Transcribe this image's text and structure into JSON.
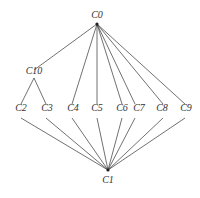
{
  "diagram": {
    "type": "hasse-lattice",
    "nodes": [
      {
        "id": "C0",
        "label": "C0",
        "x": 97,
        "y": 24,
        "lx": 97,
        "ly": 18
      },
      {
        "id": "C10",
        "label": "C10",
        "x": 34,
        "y": 78,
        "lx": 34,
        "ly": 74
      },
      {
        "id": "C2",
        "label": "C2",
        "x": 21,
        "y": 116,
        "lx": 21,
        "ly": 111
      },
      {
        "id": "C3",
        "label": "C3",
        "x": 46,
        "y": 116,
        "lx": 47,
        "ly": 111
      },
      {
        "id": "C4",
        "label": "C4",
        "x": 72,
        "y": 116,
        "lx": 73,
        "ly": 111
      },
      {
        "id": "C5",
        "label": "C5",
        "x": 97,
        "y": 116,
        "lx": 97,
        "ly": 111
      },
      {
        "id": "C6",
        "label": "C6",
        "x": 122,
        "y": 116,
        "lx": 122,
        "ly": 111
      },
      {
        "id": "C7",
        "label": "C7",
        "x": 135,
        "y": 116,
        "lx": 139,
        "ly": 111
      },
      {
        "id": "C8",
        "label": "C8",
        "x": 163,
        "y": 116,
        "lx": 162,
        "ly": 111
      },
      {
        "id": "C9",
        "label": "C9",
        "x": 185,
        "y": 116,
        "lx": 186,
        "ly": 111
      },
      {
        "id": "C1",
        "label": "C1",
        "x": 108,
        "y": 170,
        "lx": 108,
        "ly": 183
      }
    ],
    "edges": [
      [
        "C0",
        "C10"
      ],
      [
        "C0",
        "C4"
      ],
      [
        "C0",
        "C5"
      ],
      [
        "C0",
        "C6"
      ],
      [
        "C0",
        "C7"
      ],
      [
        "C0",
        "C8"
      ],
      [
        "C0",
        "C9"
      ],
      [
        "C10",
        "C2"
      ],
      [
        "C10",
        "C3"
      ],
      [
        "C2",
        "C1"
      ],
      [
        "C3",
        "C1"
      ],
      [
        "C4",
        "C1"
      ],
      [
        "C5",
        "C1"
      ],
      [
        "C6",
        "C1"
      ],
      [
        "C7",
        "C1"
      ],
      [
        "C8",
        "C1"
      ],
      [
        "C9",
        "C1"
      ]
    ],
    "upper_stub_points": {
      "C4": [
        72,
        97
      ],
      "C5": [
        97,
        97
      ],
      "C6": [
        122,
        97
      ],
      "C7": [
        135,
        97
      ],
      "C8": [
        163,
        97
      ],
      "C9": [
        185,
        97
      ]
    }
  }
}
